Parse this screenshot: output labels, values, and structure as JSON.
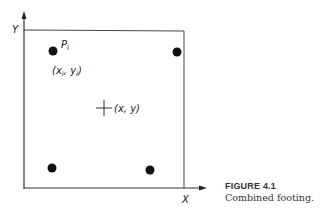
{
  "figure": {
    "axes": {
      "x_label": "X",
      "y_label": "Y"
    },
    "points": {
      "pi_label": "Pi",
      "pi_sub": "i",
      "pi_coords": "(xi, yi)",
      "centroid_label": "(x, y)"
    },
    "caption": {
      "title": "FIGURE 4.1",
      "text": "Combined footing."
    }
  }
}
